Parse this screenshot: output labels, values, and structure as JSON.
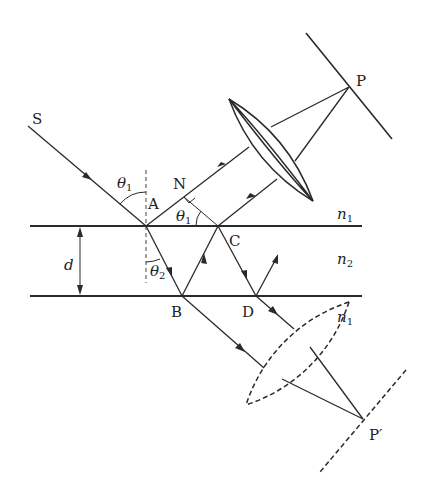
{
  "diagram": {
    "type": "thin-film interference ray diagram",
    "points": {
      "S": "S",
      "A": "A",
      "B": "B",
      "C": "C",
      "D": "D",
      "N": "N",
      "P": "P",
      "P_prime": "P′"
    },
    "angles": {
      "incident": "θ",
      "incident_sub": "1",
      "angle_at_C": "θ",
      "angle_at_C_sub": "1",
      "refracted": "θ",
      "refracted_sub": "2"
    },
    "media": {
      "top": "n",
      "top_sub": "1",
      "film": "n",
      "film_sub": "2",
      "bottom": "n",
      "bottom_sub": "1"
    },
    "thickness": "d",
    "elements": [
      "incident ray S→A",
      "reflected ray A→N→lens→P",
      "refracted ray A→B",
      "ray B→C",
      "ray C→lens→P",
      "ray C→D",
      "ray D up",
      "transmitted ray B→lens→P′",
      "transmitted ray D→lens→P′",
      "converging lens (solid)",
      "converging lens (dashed)",
      "screen at P (solid)",
      "screen at P′ (dashed)",
      "normal at A (dashed)",
      "right-angle mark at N"
    ]
  }
}
